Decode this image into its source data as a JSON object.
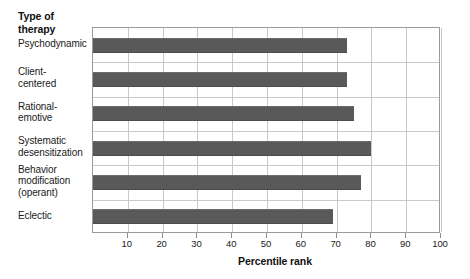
{
  "chart_data": {
    "type": "bar",
    "orientation": "horizontal",
    "title": "",
    "ylabel": "Type of\ntherapy",
    "xlabel": "Percentile rank",
    "categories": [
      "Psychodynamic",
      "Client-\ncentered",
      "Rational-\nemotive",
      "Systematic\ndesensitization",
      "Behavior\nmodification\n(operant)",
      "Eclectic"
    ],
    "values": [
      73,
      73,
      75,
      80,
      77,
      69
    ],
    "xlim": [
      0,
      100
    ],
    "xticks": [
      10,
      20,
      30,
      40,
      50,
      60,
      70,
      80,
      90,
      100
    ],
    "xtick_labels": [
      "10",
      "20",
      "30",
      "40",
      "50",
      "60",
      "70",
      "80",
      "90",
      "100"
    ],
    "grid": "vertical-and-horizontal",
    "legend": "none",
    "bar_color": "#595959",
    "grid_color": "#c9c9c9",
    "axis_color": "#9a9a9a",
    "background": "#ffffff"
  }
}
